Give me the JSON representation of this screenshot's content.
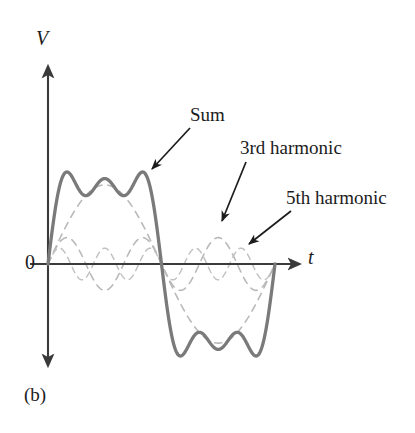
{
  "figure": {
    "caption": "(b)",
    "axes": {
      "y_label": "V",
      "x_label": "t",
      "origin_label": "0"
    },
    "annotations": [
      {
        "name": "sum",
        "label": "Sum"
      },
      {
        "name": "third-harmonic",
        "label": "3rd harmonic"
      },
      {
        "name": "fifth-harmonic",
        "label": "5th harmonic"
      }
    ],
    "colors": {
      "sum_curve": "#7a7a7a",
      "harmonic_curve": "#b9b9b9",
      "axis": "#3a3a3a",
      "text": "#1c1c1c",
      "background": "#ffffff"
    }
  },
  "chart_data": {
    "type": "line",
    "title": "",
    "subtitle": "(b)",
    "xlabel": "t",
    "ylabel": "V",
    "grid": false,
    "legend": "annotations",
    "x_axis": {
      "origin_px": 48,
      "arrow_tip_px": 303,
      "baseline_y_px": 264,
      "periods_shown": 1,
      "tick_labels": []
    },
    "y_axis": {
      "axis_x_px": 48,
      "top_arrow_px": 62,
      "bottom_arrow_px": 370,
      "tick_labels": [],
      "ylim": [
        -1.4,
        1.4
      ]
    },
    "series": [
      {
        "name": "Sum",
        "style": "solid",
        "color": "#7a7a7a",
        "width_px": 3.2,
        "formula": "sin(x) + sin(3x)/3 + sin(5x)/5",
        "amplitude_scale": 1.0,
        "annotation": "Sum"
      },
      {
        "name": "Fundamental",
        "style": "dashed",
        "color": "#b9b9b9",
        "width_px": 1.6,
        "formula": "sin(x)",
        "amplitude_scale": 1.0,
        "annotation": ""
      },
      {
        "name": "3rd harmonic",
        "style": "dashed",
        "color": "#b9b9b9",
        "width_px": 1.6,
        "formula": "sin(3x)/3",
        "amplitude_scale": 0.3333,
        "annotation": "3rd harmonic"
      },
      {
        "name": "5th harmonic",
        "style": "dashed",
        "color": "#b9b9b9",
        "width_px": 1.6,
        "formula": "sin(5x)/5",
        "amplitude_scale": 0.2,
        "annotation": "5th harmonic"
      }
    ],
    "arrows": [
      {
        "name": "sum-arrow",
        "from": [
          190,
          128
        ],
        "to": [
          152,
          169
        ]
      },
      {
        "name": "third-arrow",
        "from": [
          246,
          162
        ],
        "to": [
          222,
          221
        ]
      },
      {
        "name": "fifth-arrow",
        "from": [
          291,
          211
        ],
        "to": [
          249,
          244
        ]
      }
    ]
  }
}
